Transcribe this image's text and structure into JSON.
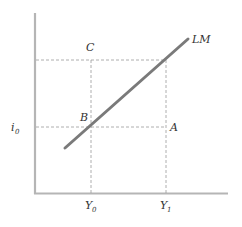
{
  "diagram": {
    "curve_label": "LM",
    "points": {
      "A": "A",
      "B": "B",
      "C": "C"
    },
    "y_axis_label": {
      "main": "i",
      "sub": "0"
    },
    "x_ticks": [
      {
        "main": "Y",
        "sub": "0"
      },
      {
        "main": "Y",
        "sub": "1"
      }
    ],
    "colors": {
      "axis": "#b0b0b0",
      "curve": "#7a7a7a",
      "dash": "#9a9a9a",
      "text": "#333333"
    }
  }
}
